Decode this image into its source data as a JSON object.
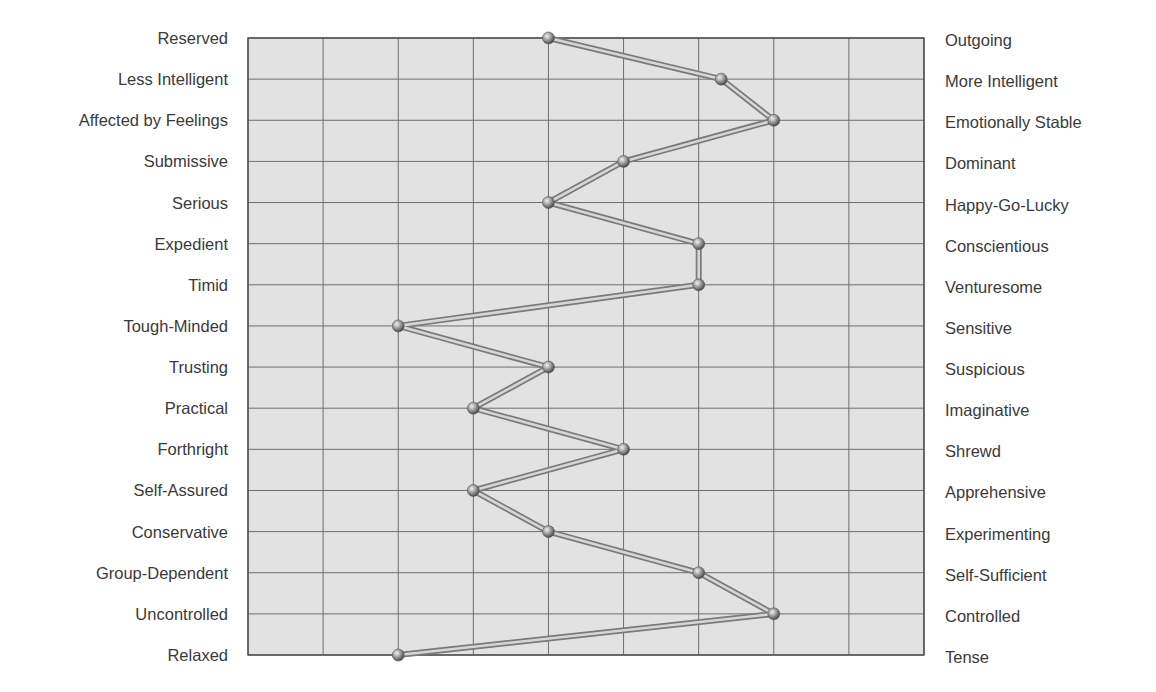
{
  "chart_data": {
    "type": "line",
    "orientation": "horizontal-profile",
    "title": "",
    "xlabel": "",
    "ylabel": "",
    "xlim": [
      1,
      10
    ],
    "x_gridlines": 10,
    "grid": true,
    "legend": null,
    "traits": [
      {
        "left": "Reserved",
        "right": "Outgoing",
        "value": 5
      },
      {
        "left": "Less Intelligent",
        "right": "More Intelligent",
        "value": 7.3
      },
      {
        "left": "Affected by Feelings",
        "right": "Emotionally Stable",
        "value": 8
      },
      {
        "left": "Submissive",
        "right": "Dominant",
        "value": 6
      },
      {
        "left": "Serious",
        "right": "Happy-Go-Lucky",
        "value": 5
      },
      {
        "left": "Expedient",
        "right": "Conscientious",
        "value": 7
      },
      {
        "left": "Timid",
        "right": "Venturesome",
        "value": 7
      },
      {
        "left": "Tough-Minded",
        "right": "Sensitive",
        "value": 3
      },
      {
        "left": "Trusting",
        "right": "Suspicious",
        "value": 5
      },
      {
        "left": "Practical",
        "right": "Imaginative",
        "value": 4
      },
      {
        "left": "Forthright",
        "right": "Shrewd",
        "value": 6
      },
      {
        "left": "Self-Assured",
        "right": "Apprehensive",
        "value": 4
      },
      {
        "left": "Conservative",
        "right": "Experimenting",
        "value": 5
      },
      {
        "left": "Group-Dependent",
        "right": "Self-Sufficient",
        "value": 7
      },
      {
        "left": "Uncontrolled",
        "right": "Controlled",
        "value": 8
      },
      {
        "left": "Relaxed",
        "right": "Tense",
        "value": 3
      }
    ]
  },
  "style": {
    "plot_bg": "#e2e2e2",
    "grid_color": "#6e6e6e",
    "frame_color": "#4a4a4a",
    "line_outer": "#7a7a7a",
    "line_inner": "#d6d6d6",
    "marker_light": "#b8b8b8",
    "marker_dark": "#4a4a4a"
  }
}
